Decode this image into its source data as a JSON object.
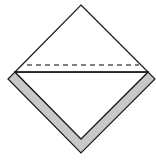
{
  "diagram": {
    "type": "origami-fold-step",
    "colors": {
      "background": "#ffffff",
      "paper": "#ffffff",
      "folded_band": "#c8c8c8",
      "stroke": "#1a1a1a",
      "dashed_line": "#555555"
    },
    "shapes": {
      "top_triangle": {
        "points": "81,5 148,72 15,72"
      },
      "inner_bottom_triangle": {
        "points": "15,72 148,72 81,139"
      },
      "outer_band": {
        "points": "8,79 15,72 81,139 148,72 155,79 81,153"
      },
      "solid_crease": {
        "x1": 15,
        "y1": 72,
        "x2": 148,
        "y2": 72
      },
      "dashed_fold": {
        "x1": 27,
        "y1": 65,
        "x2": 139,
        "y2": 65
      }
    }
  }
}
